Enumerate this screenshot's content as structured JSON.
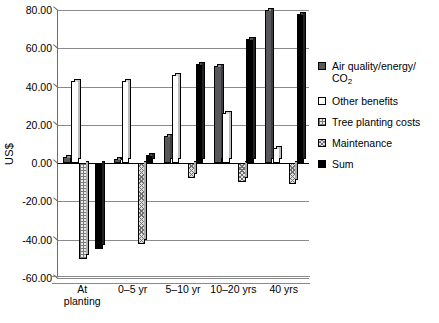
{
  "chart_data": {
    "type": "bar",
    "title": "",
    "xlabel": "",
    "ylabel": "US$",
    "ylim": [
      -60.0,
      80.0
    ],
    "ytick_labels": [
      "80.00",
      "60.00",
      "40.00",
      "20.00",
      "0.00",
      "-20.00",
      "-40.00",
      "-60.00"
    ],
    "ytick_values": [
      80,
      60,
      40,
      20,
      0,
      -20,
      -40,
      -60
    ],
    "grid": true,
    "legend_position": "right",
    "categories": [
      "At\nplanting",
      "0–5 yr",
      "5–10 yr",
      "10–20 yrs",
      "40 yrs"
    ],
    "series": [
      {
        "name": "Air quality/energy/CO2",
        "legend_label": "Air quality/energy/",
        "legend_label_line2": "CO",
        "legend_label_sub": "2",
        "fill": "dark-gray-solid",
        "color": "#58585a",
        "values": [
          3.0,
          2.0,
          14.0,
          51.0,
          80.0
        ]
      },
      {
        "name": "Other benefits",
        "legend_label": "Other benefits",
        "fill": "white",
        "color": "#ffffff",
        "values": [
          43.0,
          43.0,
          46.0,
          26.0,
          8.0
        ]
      },
      {
        "name": "Tree planting costs",
        "legend_label": "Tree planting costs",
        "fill": "fine-grid-hatch",
        "color": "#eaeaea",
        "values": [
          -50.0,
          0.0,
          0.0,
          0.0,
          0.0
        ]
      },
      {
        "name": "Maintenance",
        "legend_label": "Maintenance",
        "fill": "cross-hatch",
        "color": "#e2e2e2",
        "values": [
          0.0,
          -42.0,
          -8.0,
          -10.0,
          -11.0
        ]
      },
      {
        "name": "Sum",
        "legend_label": "Sum",
        "fill": "black-solid",
        "color": "#000000",
        "values": [
          -45.0,
          4.0,
          52.0,
          65.0,
          78.0
        ]
      }
    ]
  },
  "axis": {
    "y_title": "US$"
  }
}
